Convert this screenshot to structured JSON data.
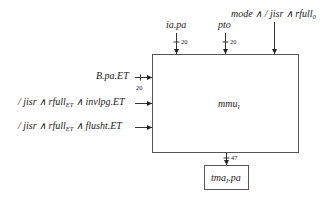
{
  "diagram": {
    "main_block": {
      "label": "mmu",
      "subscript": "I"
    },
    "output_block": {
      "label_prefix": "tma",
      "subscript": "I",
      "label_suffix": ".pa"
    },
    "top_inputs": [
      {
        "label": "ia.pa",
        "width": "20"
      },
      {
        "label": "pto",
        "width": "20"
      },
      {
        "label": "mode ∧ / jisr ∧ rfull",
        "subscript": "0"
      }
    ],
    "left_inputs": [
      {
        "label": "B.pa.ET",
        "width": "20"
      },
      {
        "label_a": "/ jisr ∧ rfull",
        "sub": "ET",
        "label_b": " ∧ invlpg.ET"
      },
      {
        "label_a": "/ jisr ∧ rfull",
        "sub": "ET",
        "label_b": " ∧ flusht.ET"
      }
    ],
    "output": {
      "width": "47"
    }
  }
}
